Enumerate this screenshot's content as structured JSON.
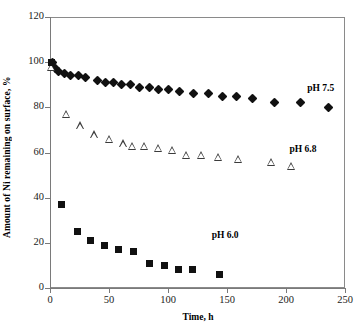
{
  "chart_data": {
    "type": "scatter",
    "title": "",
    "xlabel": "Time, h",
    "ylabel": "Amount of Ni remaining on surface, %",
    "xlim": [
      0,
      250
    ],
    "ylim": [
      0,
      120
    ],
    "xticks": [
      0,
      50,
      100,
      150,
      200,
      250
    ],
    "yticks": [
      0,
      20,
      40,
      60,
      80,
      100,
      120
    ],
    "grid": false,
    "legend_position": "inline-annotations",
    "series": [
      {
        "name": "pH 7.5",
        "marker": "filled-diamond",
        "color": "#111111",
        "annotation": "pH 7.5",
        "annotation_x": 218,
        "annotation_y": 88,
        "points": [
          {
            "x": 2,
            "y": 100
          },
          {
            "x": 5,
            "y": 97
          },
          {
            "x": 7,
            "y": 96
          },
          {
            "x": 12,
            "y": 95
          },
          {
            "x": 17,
            "y": 94
          },
          {
            "x": 24,
            "y": 94
          },
          {
            "x": 30,
            "y": 93
          },
          {
            "x": 40,
            "y": 92
          },
          {
            "x": 47,
            "y": 91
          },
          {
            "x": 54,
            "y": 91
          },
          {
            "x": 61,
            "y": 90
          },
          {
            "x": 68,
            "y": 90
          },
          {
            "x": 76,
            "y": 89
          },
          {
            "x": 84,
            "y": 89
          },
          {
            "x": 92,
            "y": 88
          },
          {
            "x": 100,
            "y": 88
          },
          {
            "x": 110,
            "y": 87
          },
          {
            "x": 122,
            "y": 86
          },
          {
            "x": 134,
            "y": 86
          },
          {
            "x": 146,
            "y": 85
          },
          {
            "x": 158,
            "y": 85
          },
          {
            "x": 172,
            "y": 84
          },
          {
            "x": 190,
            "y": 82
          },
          {
            "x": 212,
            "y": 82
          },
          {
            "x": 236,
            "y": 80
          }
        ]
      },
      {
        "name": "pH 6.8",
        "marker": "open-triangle",
        "color": "#3b3b3b",
        "annotation": "pH 6.8",
        "annotation_x": 203,
        "annotation_y": 61,
        "points": [
          {
            "x": 1,
            "y": 98
          },
          {
            "x": 14,
            "y": 77
          },
          {
            "x": 26,
            "y": 72
          },
          {
            "x": 38,
            "y": 68
          },
          {
            "x": 50,
            "y": 66
          },
          {
            "x": 62,
            "y": 64
          },
          {
            "x": 70,
            "y": 63
          },
          {
            "x": 80,
            "y": 63
          },
          {
            "x": 92,
            "y": 62
          },
          {
            "x": 104,
            "y": 61
          },
          {
            "x": 116,
            "y": 59
          },
          {
            "x": 128,
            "y": 59
          },
          {
            "x": 143,
            "y": 58
          },
          {
            "x": 160,
            "y": 57
          },
          {
            "x": 188,
            "y": 56
          },
          {
            "x": 205,
            "y": 54
          }
        ]
      },
      {
        "name": "pH 6.0",
        "marker": "filled-square",
        "color": "#111111",
        "annotation": "pH 6.0",
        "annotation_x": 137,
        "annotation_y": 23,
        "points": [
          {
            "x": 1,
            "y": 100
          },
          {
            "x": 10,
            "y": 37
          },
          {
            "x": 23,
            "y": 25
          },
          {
            "x": 34,
            "y": 21
          },
          {
            "x": 46,
            "y": 19
          },
          {
            "x": 58,
            "y": 17
          },
          {
            "x": 71,
            "y": 16
          },
          {
            "x": 84,
            "y": 11
          },
          {
            "x": 97,
            "y": 10
          },
          {
            "x": 109,
            "y": 8
          },
          {
            "x": 121,
            "y": 8
          },
          {
            "x": 144,
            "y": 6
          }
        ]
      }
    ]
  },
  "axes": {
    "x_title": "Time, h",
    "y_title": "Amount of Ni remaining on surface, %",
    "x_tick_labels": [
      "0",
      "50",
      "100",
      "150",
      "200",
      "250"
    ],
    "y_tick_labels": [
      "0",
      "20",
      "40",
      "60",
      "80",
      "100",
      "120"
    ]
  }
}
